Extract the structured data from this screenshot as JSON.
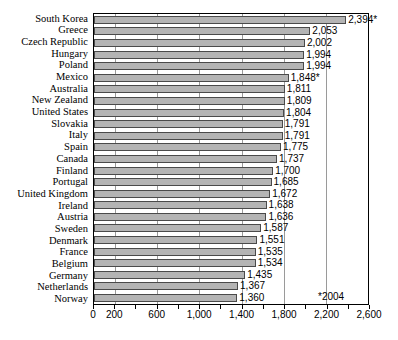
{
  "chart_data": {
    "type": "bar",
    "orientation": "horizontal",
    "title": "",
    "subtitle": "",
    "xlabel": "",
    "ylabel": "",
    "xlim": [
      0,
      2600
    ],
    "grid": true,
    "legend": null,
    "categories": [
      "South Korea",
      "Greece",
      "Czech Republic",
      "Hungary",
      "Poland",
      "Mexico",
      "Australia",
      "New Zealand",
      "United States",
      "Slovakia",
      "Italy",
      "Spain",
      "Canada",
      "Finland",
      "Portugal",
      "United Kingdom",
      "Ireland",
      "Austria",
      "Sweden",
      "Denmark",
      "France",
      "Belgium",
      "Germany",
      "Netherlands",
      "Norway"
    ],
    "values": [
      2394,
      2053,
      2002,
      1994,
      1994,
      1848,
      1811,
      1809,
      1804,
      1791,
      1791,
      1775,
      1737,
      1700,
      1685,
      1672,
      1638,
      1636,
      1587,
      1551,
      1535,
      1534,
      1435,
      1367,
      1360
    ],
    "value_labels": [
      "2,394*",
      "2,053",
      "2,002",
      "1,994",
      "1,994",
      "1,848*",
      "1,811",
      "1,809",
      "1,804",
      "1,791",
      "1,791",
      "1,775",
      "1,737",
      "1,700",
      "1,685",
      "1,672",
      "1,638",
      "1,636",
      "1,587",
      "1,551",
      "1,535",
      "1,534",
      "1,435",
      "1,367",
      "1,360"
    ],
    "xticks": [
      0,
      200,
      400,
      600,
      800,
      1000,
      1200,
      1400,
      1600,
      1800,
      2000,
      2200,
      2400,
      2600
    ],
    "xticklabels": [
      {
        "value": 0,
        "label": "0"
      },
      {
        "value": 200,
        "label": "200"
      },
      {
        "value": 600,
        "label": "600"
      },
      {
        "value": 1000,
        "label": "1,000"
      },
      {
        "value": 1400,
        "label": "1,400"
      },
      {
        "value": 1800,
        "label": "1,800"
      },
      {
        "value": 2200,
        "label": "2,200"
      },
      {
        "value": 2600,
        "label": "2,600"
      }
    ],
    "gridline_values": [
      200,
      600,
      1000,
      1400,
      1800,
      2200
    ],
    "annotations": [
      {
        "name": "footnote",
        "text": "*2004"
      }
    ],
    "colors": {
      "bar_fill": "#b4b4b4",
      "bar_border": "#4a4a4a",
      "axis": "#000000",
      "gridline": "#9a9a9a",
      "background": "#ffffff",
      "text": "#000000"
    }
  }
}
